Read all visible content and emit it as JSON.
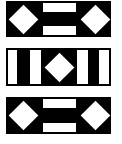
{
  "canvas": {
    "width": 122,
    "height": 144,
    "background": "#ffffff"
  },
  "colors": {
    "ink": "#000000",
    "paper": "#ffffff"
  },
  "panels": [
    {
      "name": "top-panel",
      "pattern": "diamond-bars-diamond",
      "rect": {
        "x": 6,
        "y": 1,
        "w": 105,
        "h": 36
      },
      "bars": [
        {
          "name": "top-bar",
          "x": 43,
          "y": 3,
          "w": 33,
          "h": 9
        },
        {
          "name": "bottom-bar",
          "x": 43,
          "y": 26,
          "w": 33,
          "h": 9
        }
      ],
      "diamonds": [
        {
          "name": "left-diamond",
          "cx": 23,
          "cy": 19,
          "size": 21
        },
        {
          "name": "right-diamond",
          "cx": 95,
          "cy": 19,
          "size": 21
        }
      ]
    },
    {
      "name": "middle-panel",
      "pattern": "bars-diamond-bars",
      "rect": {
        "x": 6,
        "y": 48,
        "w": 105,
        "h": 38
      },
      "bars": [
        {
          "name": "left-outer-bar",
          "x": 8,
          "y": 50,
          "w": 9,
          "h": 34
        },
        {
          "name": "left-inner-bar",
          "x": 30,
          "y": 50,
          "w": 11,
          "h": 34
        },
        {
          "name": "right-inner-bar",
          "x": 77,
          "y": 50,
          "w": 11,
          "h": 34
        },
        {
          "name": "right-outer-bar",
          "x": 99,
          "y": 50,
          "w": 10,
          "h": 34
        }
      ],
      "diamonds": [
        {
          "name": "center-diamond",
          "cx": 59,
          "cy": 67,
          "size": 21
        }
      ]
    },
    {
      "name": "bottom-panel",
      "pattern": "diamond-bars-diamond",
      "rect": {
        "x": 6,
        "y": 97,
        "w": 105,
        "h": 37
      },
      "bars": [
        {
          "name": "top-bar",
          "x": 43,
          "y": 99,
          "w": 33,
          "h": 9
        },
        {
          "name": "bottom-bar",
          "x": 43,
          "y": 123,
          "w": 33,
          "h": 9
        }
      ],
      "diamonds": [
        {
          "name": "left-diamond",
          "cx": 23,
          "cy": 115,
          "size": 21
        },
        {
          "name": "right-diamond",
          "cx": 95,
          "cy": 115,
          "size": 21
        }
      ]
    }
  ]
}
